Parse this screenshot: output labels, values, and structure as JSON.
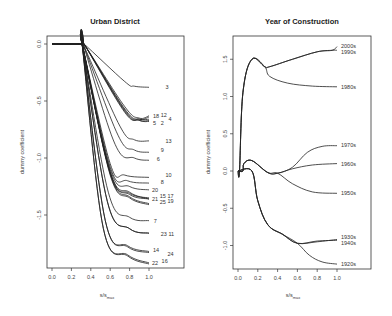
{
  "chart_data": [
    {
      "type": "line",
      "title": "Urban District",
      "xlabel": "s/s_max",
      "ylabel": "dummy coefficient",
      "xlim": [
        -0.05,
        1.2
      ],
      "ylim": [
        -1.95,
        0.08
      ],
      "xticks": [
        "0.0",
        "0.2",
        "0.4",
        "0.6",
        "0.8",
        "1.0"
      ],
      "yticks": [
        "0.0",
        "-0.5",
        "-1.0",
        "-1.5"
      ],
      "grid": false,
      "series": [
        {
          "name": "3",
          "x": [
            0,
            0.3,
            0.33,
            0.75,
            0.85,
            1.0
          ],
          "y": [
            0,
            0,
            0,
            -0.33,
            -0.37,
            -0.38
          ],
          "label_pos": [
            1.17,
            -0.38
          ]
        },
        {
          "name": "18",
          "x": [
            0,
            0.3,
            0.33,
            0.75,
            0.9,
            1.0
          ],
          "y": [
            0,
            0,
            0,
            -0.55,
            -0.65,
            -0.63
          ],
          "label_pos": [
            1.04,
            -0.63
          ]
        },
        {
          "name": "12",
          "x": [
            0,
            0.3,
            0.33,
            0.75,
            0.9,
            1.0
          ],
          "y": [
            0,
            0,
            0,
            -0.57,
            -0.66,
            -0.64
          ],
          "label_pos": [
            1.12,
            -0.62
          ]
        },
        {
          "name": "5",
          "x": [
            0,
            0.3,
            0.33,
            0.75,
            0.9,
            1.0
          ],
          "y": [
            0,
            0,
            0,
            -0.58,
            -0.67,
            -0.68
          ],
          "label_pos": [
            1.04,
            -0.69
          ]
        },
        {
          "name": "2",
          "x": [
            0,
            0.3,
            0.33,
            0.75,
            0.9,
            1.0
          ],
          "y": [
            0,
            0,
            0,
            -0.59,
            -0.67,
            -0.67
          ],
          "label_pos": [
            1.12,
            -0.69
          ]
        },
        {
          "name": "4",
          "x": [
            0,
            0.3,
            0.33,
            0.75,
            0.9,
            1.0
          ],
          "y": [
            0,
            0,
            0,
            -0.6,
            -0.66,
            -0.66
          ],
          "label_pos": [
            1.2,
            -0.66
          ]
        },
        {
          "name": "13",
          "x": [
            0,
            0.3,
            0.32,
            0.7,
            0.85,
            1.0
          ],
          "y": [
            0,
            0,
            0,
            -0.72,
            -0.84,
            -0.85
          ],
          "label_pos": [
            1.17,
            -0.85
          ]
        },
        {
          "name": "9",
          "x": [
            0,
            0.3,
            0.32,
            0.68,
            0.85,
            1.0
          ],
          "y": [
            0,
            0,
            0,
            -0.8,
            -0.93,
            -0.95
          ],
          "label_pos": [
            1.12,
            -0.93
          ]
        },
        {
          "name": "6",
          "x": [
            0,
            0.3,
            0.32,
            0.65,
            0.85,
            1.0
          ],
          "y": [
            0,
            0,
            0,
            -0.88,
            -1.0,
            -1.02
          ],
          "label_pos": [
            1.08,
            -1.01
          ]
        },
        {
          "name": "10",
          "x": [
            0,
            0.3,
            0.31,
            0.6,
            0.75,
            1.0
          ],
          "y": [
            0,
            0,
            0,
            -1.05,
            -1.15,
            -1.17
          ],
          "label_pos": [
            1.17,
            -1.15
          ]
        },
        {
          "name": "8",
          "x": [
            0,
            0.3,
            0.31,
            0.6,
            0.78,
            1.0
          ],
          "y": [
            0,
            0,
            0,
            -1.08,
            -1.2,
            -1.22
          ],
          "label_pos": [
            1.12,
            -1.21
          ]
        },
        {
          "name": "20",
          "x": [
            0,
            0.3,
            0.31,
            0.6,
            0.8,
            1.0
          ],
          "y": [
            0,
            0,
            0,
            -1.1,
            -1.25,
            -1.28
          ],
          "label_pos": [
            1.03,
            -1.28
          ]
        },
        {
          "name": "21",
          "x": [
            0,
            0.3,
            0.31,
            0.6,
            0.8,
            1.0
          ],
          "y": [
            0,
            0,
            0,
            -1.12,
            -1.3,
            -1.36
          ],
          "label_pos": [
            1.03,
            -1.36
          ]
        },
        {
          "name": "15",
          "x": [
            0,
            0.3,
            0.31,
            0.6,
            0.8,
            1.0
          ],
          "y": [
            0,
            0,
            0,
            -1.13,
            -1.31,
            -1.35
          ],
          "label_pos": [
            1.11,
            -1.33
          ]
        },
        {
          "name": "17",
          "x": [
            0,
            0.3,
            0.31,
            0.6,
            0.8,
            1.0
          ],
          "y": [
            0,
            0,
            0,
            -1.13,
            -1.32,
            -1.36
          ],
          "label_pos": [
            1.19,
            -1.33
          ]
        },
        {
          "name": "25",
          "x": [
            0,
            0.3,
            0.31,
            0.6,
            0.8,
            1.0
          ],
          "y": [
            0,
            0,
            0,
            -1.14,
            -1.34,
            -1.4
          ],
          "label_pos": [
            1.11,
            -1.39
          ]
        },
        {
          "name": "19",
          "x": [
            0,
            0.3,
            0.31,
            0.6,
            0.8,
            1.0
          ],
          "y": [
            0,
            0,
            0,
            -1.15,
            -1.35,
            -1.41
          ],
          "label_pos": [
            1.19,
            -1.38
          ]
        },
        {
          "name": "7",
          "x": [
            0,
            0.3,
            0.31,
            0.58,
            0.8,
            1.0
          ],
          "y": [
            0,
            0,
            0,
            -1.3,
            -1.52,
            -1.55
          ],
          "label_pos": [
            1.05,
            -1.55
          ]
        },
        {
          "name": "23",
          "x": [
            0,
            0.3,
            0.31,
            0.57,
            0.8,
            1.0
          ],
          "y": [
            0,
            0,
            0,
            -1.38,
            -1.62,
            -1.66
          ],
          "label_pos": [
            1.12,
            -1.67
          ]
        },
        {
          "name": "11",
          "x": [
            0,
            0.3,
            0.31,
            0.57,
            0.8,
            1.0
          ],
          "y": [
            0,
            0,
            0,
            -1.38,
            -1.62,
            -1.66
          ],
          "label_pos": [
            1.2,
            -1.67
          ]
        },
        {
          "name": "14",
          "x": [
            0,
            0.3,
            0.31,
            0.55,
            0.78,
            1.0
          ],
          "y": [
            0,
            0,
            0,
            -1.55,
            -1.77,
            -1.82
          ],
          "label_pos": [
            1.04,
            -1.81
          ]
        },
        {
          "name": "24",
          "x": [
            0,
            0.3,
            0.31,
            0.55,
            0.78,
            1.0
          ],
          "y": [
            0,
            0,
            0,
            -1.55,
            -1.78,
            -1.83
          ],
          "label_pos": [
            1.19,
            -1.84
          ]
        },
        {
          "name": "22",
          "x": [
            0,
            0.3,
            0.31,
            0.53,
            0.78,
            1.0
          ],
          "y": [
            0,
            0,
            0,
            -1.62,
            -1.85,
            -1.92
          ],
          "label_pos": [
            1.03,
            -1.92
          ]
        },
        {
          "name": "16",
          "x": [
            0,
            0.3,
            0.31,
            0.53,
            0.78,
            1.0
          ],
          "y": [
            0,
            0,
            0,
            -1.62,
            -1.86,
            -1.93
          ],
          "label_pos": [
            1.13,
            -1.9
          ]
        }
      ]
    },
    {
      "type": "line",
      "title": "Year of Construction",
      "xlabel": "s/s_max",
      "ylabel": "dummy coefficient",
      "xlim": [
        -0.05,
        1.35
      ],
      "ylim": [
        -1.32,
        1.82
      ],
      "xticks": [
        "0.0",
        "0.2",
        "0.4",
        "0.6",
        "0.8",
        "1.0"
      ],
      "yticks": [
        "1.5",
        "1.0",
        "0.5",
        "0.0",
        "-0.5",
        "-1.0"
      ],
      "grid": false,
      "series": [
        {
          "name": "2000s",
          "x": [
            0,
            0.015,
            0.05,
            0.14,
            0.27,
            0.32,
            0.55,
            0.8,
            0.95,
            1.0
          ],
          "y": [
            0,
            0,
            1.05,
            1.5,
            1.4,
            1.4,
            1.5,
            1.6,
            1.62,
            1.67
          ],
          "label_pos": [
            1.04,
            1.68
          ]
        },
        {
          "name": "1990s",
          "x": [
            0,
            0.015,
            0.05,
            0.14,
            0.27,
            0.32,
            0.55,
            0.8,
            0.95,
            1.0
          ],
          "y": [
            0,
            0,
            1.05,
            1.5,
            1.4,
            1.4,
            1.5,
            1.6,
            1.62,
            1.62
          ],
          "label_pos": [
            1.04,
            1.6
          ]
        },
        {
          "name": "1980s",
          "x": [
            0,
            0.015,
            0.05,
            0.14,
            0.27,
            0.32,
            0.5,
            0.75,
            1.0
          ],
          "y": [
            0,
            0,
            1.05,
            1.5,
            1.4,
            1.27,
            1.18,
            1.14,
            1.13
          ],
          "label_pos": [
            1.04,
            1.13
          ]
        },
        {
          "name": "1970s",
          "x": [
            0,
            0.05,
            0.06,
            0.14,
            0.3,
            0.4,
            0.55,
            0.7,
            0.85,
            1.0
          ],
          "y": [
            0,
            0,
            0.1,
            0.14,
            -0.02,
            -0.03,
            0.05,
            0.25,
            0.33,
            0.34
          ],
          "label_pos": [
            1.04,
            0.35
          ]
        },
        {
          "name": "1960s",
          "x": [
            0,
            0.05,
            0.06,
            0.14,
            0.3,
            0.4,
            0.55,
            0.75,
            1.0
          ],
          "y": [
            0,
            0,
            0.1,
            0.14,
            -0.02,
            -0.03,
            0.03,
            0.08,
            0.1
          ],
          "label_pos": [
            1.04,
            0.09
          ]
        },
        {
          "name": "1950s",
          "x": [
            0,
            0.05,
            0.06,
            0.14,
            0.3,
            0.4,
            0.55,
            0.75,
            1.0
          ],
          "y": [
            0,
            0,
            0.1,
            0.14,
            -0.02,
            -0.03,
            -0.17,
            -0.28,
            -0.3
          ],
          "label_pos": [
            1.04,
            -0.3
          ]
        },
        {
          "name": "1930s",
          "x": [
            0,
            0.14,
            0.2,
            0.3,
            0.45,
            0.6,
            0.8,
            1.0
          ],
          "y": [
            0,
            0,
            -0.4,
            -0.72,
            -0.85,
            -0.97,
            -0.95,
            -0.92
          ],
          "label_pos": [
            1.04,
            -0.89
          ]
        },
        {
          "name": "1940s",
          "x": [
            0,
            0.14,
            0.2,
            0.3,
            0.45,
            0.6,
            0.8,
            1.0
          ],
          "y": [
            0,
            0,
            -0.4,
            -0.72,
            -0.85,
            -0.97,
            -0.94,
            -0.93
          ],
          "label_pos": [
            1.04,
            -0.97
          ]
        },
        {
          "name": "1920s",
          "x": [
            0,
            0.14,
            0.2,
            0.3,
            0.45,
            0.6,
            0.72,
            0.85,
            1.0
          ],
          "y": [
            0,
            0,
            -0.4,
            -0.72,
            -0.85,
            -0.97,
            -1.13,
            -1.22,
            -1.25
          ],
          "label_pos": [
            1.04,
            -1.25
          ]
        }
      ]
    }
  ],
  "panels": [
    {
      "title": "Urban District",
      "xlabel_main": "s/s",
      "xlabel_sub": "max",
      "ylabel": "dummy coefficient"
    },
    {
      "title": "Year of Construction",
      "xlabel_main": "s/s",
      "xlabel_sub": "max",
      "ylabel": "dummy coefficient"
    }
  ]
}
